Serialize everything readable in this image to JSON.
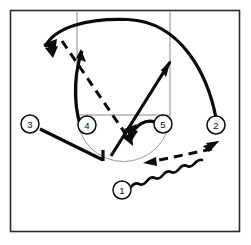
{
  "diagram": {
    "type": "half-court-play",
    "background_color": "#ffffff",
    "ink_color": "#0a0a0a",
    "court_line_color": "#8a8a8a",
    "frame": {
      "x": 10,
      "y": 10,
      "width": 230,
      "height": 222
    }
  },
  "court": {
    "lane_left_x": 77,
    "lane_right_x": 170,
    "baseline_y": 12,
    "free_throw_line_y": 115,
    "free_throw_circle_center": {
      "x": 123.5,
      "y": 115
    },
    "free_throw_circle_radius": 46
  },
  "players": [
    {
      "id": "1",
      "label": "1",
      "cx": 122,
      "cy": 190,
      "r": 9,
      "role": "point-guard"
    },
    {
      "id": "2",
      "label": "2",
      "cx": 216,
      "cy": 125,
      "r": 9,
      "role": "wing-right"
    },
    {
      "id": "3",
      "label": "3",
      "cx": 30,
      "cy": 124,
      "r": 9,
      "role": "wing-left"
    },
    {
      "id": "4",
      "label": "4",
      "cx": 87,
      "cy": 125,
      "r": 9,
      "role": "post-left"
    },
    {
      "id": "5",
      "label": "5",
      "cx": 163,
      "cy": 124,
      "r": 9,
      "role": "post-right"
    }
  ],
  "movements": [
    {
      "id": "cut-arc-top-left",
      "kind": "cut",
      "style": "solid",
      "from_player": "2",
      "description": "long arcing cut from right wing across the top to the left side",
      "path": "M 216,118 C 206,74 180,22 128,20 C 88,19 55,27 46,46",
      "arrow_at": {
        "x": 46,
        "y": 46,
        "angle": 125
      }
    },
    {
      "id": "cut-4-up",
      "kind": "cut",
      "style": "solid",
      "from_player": "4",
      "description": "player 4 curls up the left lane line toward the elbow",
      "path": "M 83,132 C 74,112 73,78 82,50",
      "arrow_at": {
        "x": 82,
        "y": 50,
        "angle": -15
      }
    },
    {
      "id": "cut-5-to-wing",
      "kind": "cut",
      "style": "solid",
      "from_player": "5",
      "description": "player 5 cuts up to the right elbow / high wing",
      "path": "M 112,155 L 169,63",
      "arrow_at": {
        "x": 169,
        "y": 63,
        "angle": -58
      }
    },
    {
      "id": "screen-3",
      "kind": "screen-cut",
      "style": "solid",
      "from_player": "3",
      "description": "player 3 cuts down toward the middle and sets up at the block",
      "path": "M 39,128 L 104,161 L 104,152",
      "arrow_at": null
    },
    {
      "id": "screen-5-hook",
      "kind": "screen",
      "style": "solid",
      "from_player": "5",
      "description": "player 5 hook / flare with arrowheads into the lane",
      "path": "M 155,122 C 144,120 136,126 131,136",
      "arrow_at": {
        "x": 131,
        "y": 137,
        "angle": 120
      }
    },
    {
      "id": "pass-top-to-lane",
      "kind": "pass",
      "style": "dashed",
      "description": "pass from the top left down into the lane",
      "path": "M 63,42 L 132,143",
      "arrow_at": {
        "x": 132,
        "y": 143,
        "angle": 56
      }
    },
    {
      "id": "pass-right-to-lane",
      "kind": "pass",
      "style": "dashed",
      "description": "pass from the right wing back to the lane area",
      "path": "M 212,148 L 144,163",
      "arrow_at": {
        "x": 144,
        "y": 163,
        "angle": 192
      }
    },
    {
      "id": "dribble-1",
      "kind": "dribble",
      "style": "wavy",
      "from_player": "1",
      "description": "player 1 dribbles up toward the right wing",
      "path": "M 131,187 L 212,146",
      "arrow_at": {
        "x": 214,
        "y": 145,
        "angle": -27
      }
    }
  ],
  "legend": {
    "solid_line": "player movement / cut",
    "dashed_line": "pass",
    "wavy_line": "dribble"
  }
}
